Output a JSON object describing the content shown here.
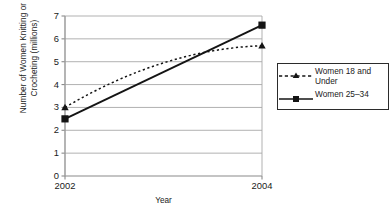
{
  "chart_data": {
    "type": "line",
    "title": "",
    "xlabel": "Year",
    "ylabel": "Number of Women Knitting or\nCrocheting (millions)",
    "x": [
      2002,
      2004
    ],
    "categories": [
      "2002",
      "2004"
    ],
    "xtick_labels": [
      "2002",
      "2004"
    ],
    "ytick_labels": [
      "0",
      "1",
      "2",
      "3",
      "4",
      "5",
      "6",
      "7"
    ],
    "ylim": [
      0,
      7
    ],
    "xlim": [
      2002,
      2004
    ],
    "grid": "horizontal",
    "legend_position": "right",
    "series": [
      {
        "name": "Women 18 and\nUnder",
        "legend_label": "Women 18 and Under",
        "values": [
          3.0,
          5.7
        ],
        "midpoint_value": 4.95,
        "style": "dashed",
        "marker": "triangle",
        "color": "#141414"
      },
      {
        "name": "Women 25–34",
        "legend_label": "Women 25–34",
        "values": [
          2.5,
          6.6
        ],
        "style": "solid",
        "marker": "square",
        "color": "#141414"
      }
    ],
    "colors": {
      "axis": "#8a8a8a",
      "grid": "#a8a8a8",
      "series": "#141414",
      "text": "#1a1a1a",
      "legend_border": "#2b2b2b",
      "background": "#ffffff"
    }
  }
}
